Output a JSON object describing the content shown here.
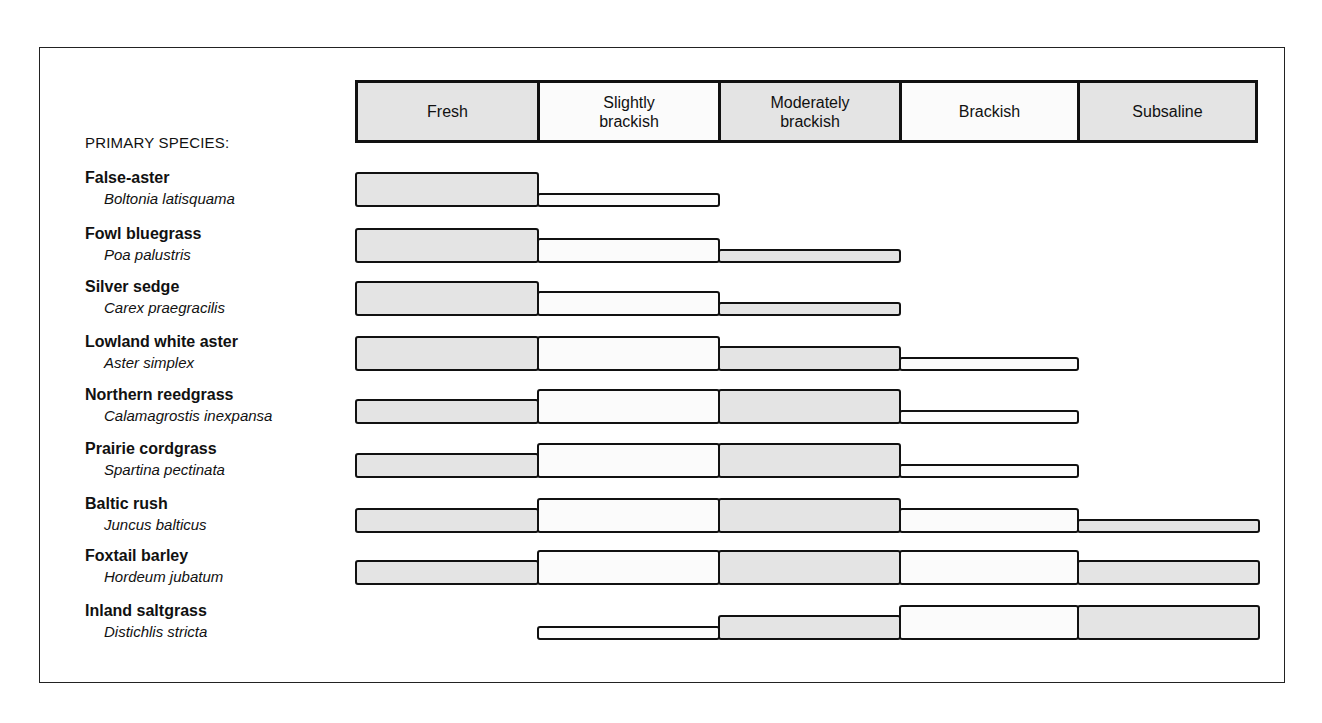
{
  "chart_data": {
    "type": "table",
    "title": "",
    "row_header": "PRIMARY SPECIES:",
    "columns": [
      "Fresh",
      "Slightly brackish",
      "Moderately brackish",
      "Brackish",
      "Subsaline"
    ],
    "column_labels_display": [
      [
        "Fresh"
      ],
      [
        "Slightly",
        "brackish"
      ],
      [
        "Moderately",
        "brackish"
      ],
      [
        "Brackish"
      ],
      [
        "Subsaline"
      ]
    ],
    "legend": "Bar thickness indicates relative abundance in each salinity zone (3 = high, 2 = medium, 1 = low, 0 = absent)",
    "rows": [
      {
        "common": "False-aster",
        "scientific": "Boltonia latisquama",
        "values": [
          3,
          1,
          0,
          0,
          0
        ]
      },
      {
        "common": "Fowl bluegrass",
        "scientific": "Poa palustris",
        "values": [
          3,
          2,
          1,
          0,
          0
        ]
      },
      {
        "common": "Silver sedge",
        "scientific": "Carex praegracilis",
        "values": [
          3,
          2,
          1,
          0,
          0
        ]
      },
      {
        "common": "Lowland white aster",
        "scientific": "Aster simplex",
        "values": [
          3,
          3,
          2,
          1,
          0
        ]
      },
      {
        "common": "Northern reedgrass",
        "scientific": "Calamagrostis inexpansa",
        "values": [
          2,
          3,
          3,
          1,
          0
        ]
      },
      {
        "common": "Prairie cordgrass",
        "scientific": "Spartina pectinata",
        "values": [
          2,
          3,
          3,
          1,
          0
        ]
      },
      {
        "common": "Baltic rush",
        "scientific": "Juncus balticus",
        "values": [
          2,
          3,
          3,
          2,
          1
        ]
      },
      {
        "common": "Foxtail barley",
        "scientific": "Hordeum jubatum",
        "values": [
          2,
          3,
          3,
          3,
          2
        ]
      },
      {
        "common": "Inland saltgrass",
        "scientific": "Distichlis stricta",
        "values": [
          0,
          1,
          2,
          3,
          3
        ]
      }
    ]
  },
  "header": {
    "primary_label": "PRIMARY SPECIES:",
    "zones": [
      {
        "line1": "Fresh",
        "line2": ""
      },
      {
        "line1": "Slightly",
        "line2": "brackish"
      },
      {
        "line1": "Moderately",
        "line2": "brackish"
      },
      {
        "line1": "Brackish",
        "line2": ""
      },
      {
        "line1": "Subsaline",
        "line2": ""
      }
    ]
  },
  "colors": {
    "shaded": "#e4e4e4",
    "light": "#fbfbfb",
    "outline": "#111111"
  }
}
